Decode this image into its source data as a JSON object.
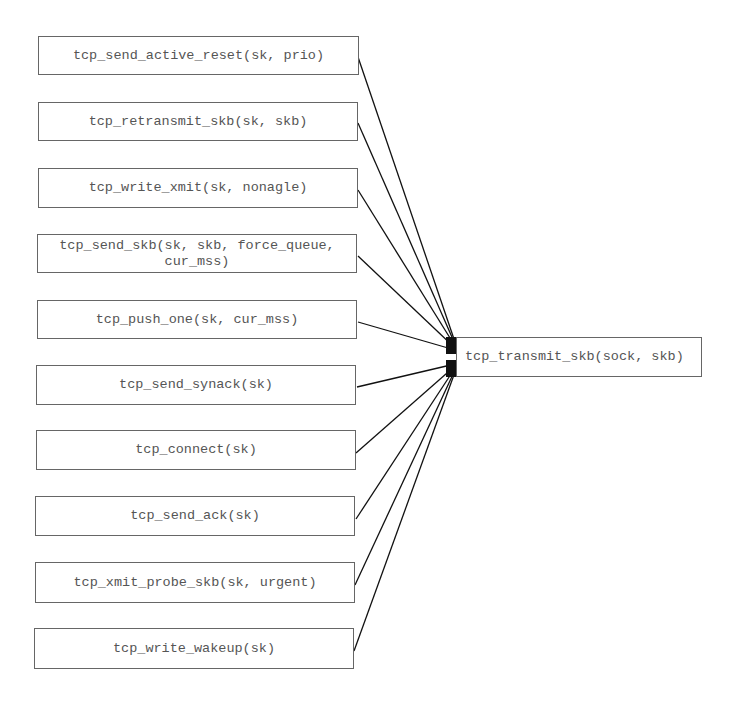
{
  "diagram": {
    "callers": [
      {
        "label": "tcp_send_active_reset(sk, prio)"
      },
      {
        "label": "tcp_retransmit_skb(sk, skb)"
      },
      {
        "label": "tcp_write_xmit(sk, nonagle)"
      },
      {
        "label": "tcp_send_skb(sk, skb, force_queue,\ncur_mss)"
      },
      {
        "label": "tcp_push_one(sk, cur_mss)"
      },
      {
        "label": "tcp_send_synack(sk)"
      },
      {
        "label": "tcp_connect(sk)"
      },
      {
        "label": "tcp_send_ack(sk)"
      },
      {
        "label": "tcp_xmit_probe_skb(sk, urgent)"
      },
      {
        "label": "tcp_write_wakeup(sk)"
      }
    ],
    "target": {
      "label": "tcp_transmit_skb(sock, skb)"
    }
  }
}
